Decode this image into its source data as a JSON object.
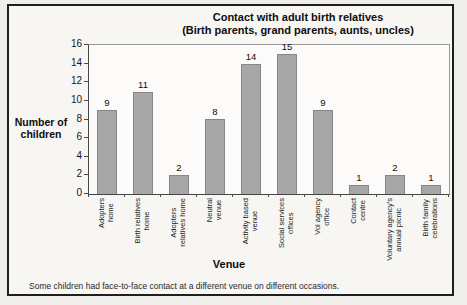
{
  "chart": {
    "title_line1": "Contact with adult birth relatives",
    "title_line2": "(Birth parents, grand parents, aunts, uncles)",
    "ylabel_line1": "Number of",
    "ylabel_line2": "children",
    "xlabel": "Venue",
    "footnote": "Some children had face-to-face contact at a different venue on different occasions."
  },
  "chart_data": {
    "type": "bar",
    "title": "Contact with adult birth relatives (Birth parents, grand parents, aunts, uncles)",
    "categories": [
      "Adopters home",
      "Birth relatives home",
      "Adopters relatives home",
      "Neutral venue",
      "Activity based venue",
      "Social services offices",
      "Vol agency office",
      "Contact centre",
      "Voluntary agency's annual picnic",
      "Birth family celebrations"
    ],
    "category_lines": [
      [
        "Adopters",
        "home"
      ],
      [
        "Birth relatives",
        "home"
      ],
      [
        "Adopters",
        "relatives home"
      ],
      [
        "Neutral",
        "venue"
      ],
      [
        "Activity based",
        "venue"
      ],
      [
        "Social services",
        "offices"
      ],
      [
        "Vol agency",
        "office"
      ],
      [
        "Contact",
        "centre"
      ],
      [
        "Voluntary agency's",
        "annual picnic"
      ],
      [
        "Birth family",
        "celebrations"
      ]
    ],
    "values": [
      9,
      11,
      2,
      8,
      14,
      15,
      9,
      1,
      2,
      1
    ],
    "xlabel": "Venue",
    "ylabel": "Number of children",
    "ylim": [
      0,
      16
    ],
    "ytick_step": 2,
    "grid": false,
    "legend": "none",
    "bar_color": "#a7a7a7",
    "bar_border_color": "#868686",
    "annotations": [
      "Some children had face-to-face contact at a different venue on different occasions."
    ]
  }
}
